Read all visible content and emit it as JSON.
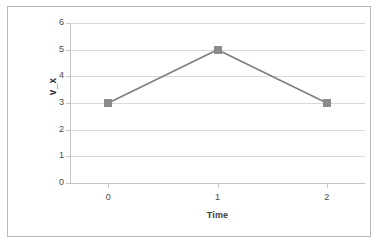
{
  "chart_data": {
    "type": "line",
    "title": "",
    "subtitle": "",
    "xlabel": "Time",
    "ylabel": "v_x",
    "x": [
      0,
      1,
      2
    ],
    "categories": [
      "0",
      "1",
      "2"
    ],
    "values": [
      3,
      5,
      3
    ],
    "series": [
      {
        "name": "v_x",
        "values": [
          3,
          5,
          3
        ],
        "line_color": "#808080",
        "marker_color": "#8b8b8b",
        "marker_shape": "square"
      }
    ],
    "xlim": [
      -0.35,
      2.35
    ],
    "ylim": [
      0,
      6
    ],
    "ytick_labels": [
      "0",
      "1",
      "2",
      "3",
      "4",
      "5",
      "6"
    ],
    "ytick_values": [
      0,
      1,
      2,
      3,
      4,
      5,
      6
    ],
    "xtick_labels": [
      "0",
      "1",
      "2"
    ],
    "xtick_values": [
      0,
      1,
      2
    ],
    "grid": "horizontal",
    "gridline_color": "#d9d9d9",
    "legend": "none",
    "legend_position": "none",
    "background": "#ffffff",
    "border_color": "#b9b9b9",
    "annotations": []
  },
  "axis_titles": {
    "x": "Time",
    "y": "v_x"
  }
}
